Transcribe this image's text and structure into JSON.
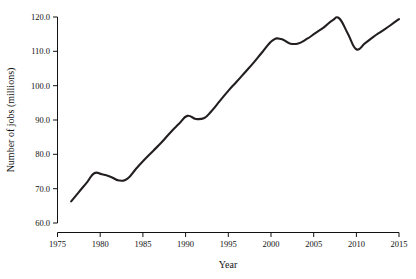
{
  "chart_data": {
    "type": "line",
    "title": "",
    "subtitle": "",
    "xlabel": "Year",
    "ylabel": "Number of jobs (millions)",
    "xlim": [
      1975,
      2015
    ],
    "ylim": [
      60.0,
      120.0
    ],
    "grid": false,
    "legend": null,
    "xticks": [
      1975,
      1980,
      1985,
      1990,
      1995,
      2000,
      2005,
      2010,
      2015
    ],
    "xtick_labels": [
      "1975",
      "1980",
      "1985",
      "1990",
      "1995",
      "2000",
      "2005",
      "2010",
      "2015"
    ],
    "yticks": [
      60.0,
      70.0,
      80.0,
      90.0,
      100.0,
      110.0,
      120.0
    ],
    "ytick_labels": [
      "60.0",
      "70.0",
      "80.0",
      "90.0",
      "100.0",
      "110.0",
      "120.0"
    ],
    "line_color": "#231f20",
    "x": [
      1976.6,
      1977.5,
      1978.5,
      1979.3,
      1980.2,
      1981.2,
      1982.2,
      1983.2,
      1984.2,
      1985.2,
      1986.2,
      1987.2,
      1988.2,
      1989.2,
      1990.2,
      1991.2,
      1992.2,
      1993.0,
      1994.0,
      1995.0,
      1996.0,
      1997.0,
      1998.0,
      1999.0,
      2000.2,
      2001.2,
      2002.2,
      2003.2,
      2004.2,
      2005.2,
      2006.2,
      2007.2,
      2008.0,
      2009.0,
      2010.0,
      2011.0,
      2012.0,
      2013.0,
      2014.0,
      2015.0
    ],
    "values": [
      66.3,
      69.0,
      72.0,
      74.5,
      74.2,
      73.5,
      72.4,
      72.9,
      75.8,
      78.5,
      81.0,
      83.5,
      86.3,
      88.8,
      91.2,
      90.3,
      90.6,
      92.5,
      95.5,
      98.5,
      101.2,
      104.0,
      106.8,
      109.8,
      113.2,
      113.6,
      112.3,
      112.3,
      113.6,
      115.3,
      117.0,
      119.0,
      119.6,
      115.2,
      110.6,
      112.3,
      114.2,
      115.9,
      117.6,
      119.4
    ],
    "annotations": []
  }
}
